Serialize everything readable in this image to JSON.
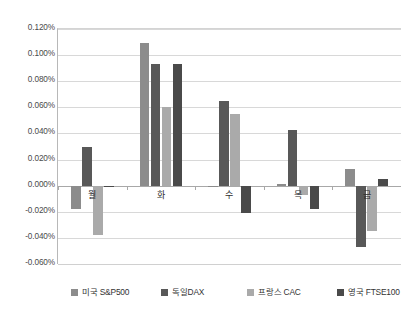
{
  "chart_data": {
    "type": "bar",
    "title": "",
    "subtitle": "",
    "xlabel": "",
    "ylabel": "",
    "categories": [
      "월",
      "화",
      "수",
      "목",
      "금"
    ],
    "series": [
      {
        "name": "미국 S&P500",
        "color": "#8c8c8c",
        "values": [
          -0.018,
          0.109,
          -0.001,
          0.001,
          0.013
        ]
      },
      {
        "name": "독일DAX",
        "color": "#585858",
        "values": [
          0.03,
          0.093,
          0.065,
          0.043,
          -0.047
        ]
      },
      {
        "name": "프랑스 CAC",
        "color": "#aaaaaa",
        "values": [
          -0.038,
          0.06,
          0.055,
          -0.007,
          -0.035
        ]
      },
      {
        "name": "영국 FTSE100",
        "color": "#4a4a4a",
        "values": [
          -0.001,
          0.093,
          -0.021,
          -0.018,
          0.005
        ]
      }
    ],
    "unit": "%",
    "ylim": [
      -0.06,
      0.12
    ],
    "ytick_step": 0.02,
    "ytick_labels": [
      "0.120%",
      "0.100%",
      "0.080%",
      "0.060%",
      "0.040%",
      "0.020%",
      "0.000%",
      "-0.020%",
      "-0.040%",
      "-0.060%"
    ],
    "ytick_values": [
      0.12,
      0.1,
      0.08,
      0.06,
      0.04,
      0.02,
      0.0,
      -0.02,
      -0.04,
      -0.06
    ],
    "grid": true,
    "grid_axis": "y",
    "legend_position": "bottom",
    "background_color": "#ffffff",
    "gridline_color": "#d8d8d8",
    "zeroline_color": "#a8a8a8"
  }
}
